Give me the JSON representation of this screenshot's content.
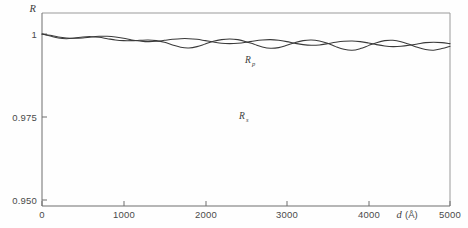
{
  "figure": {
    "background_color": "#fefefe",
    "curve_color": "#3a3a3a",
    "axis_color": "#6e6e6e"
  },
  "axes": {
    "y_title": "R",
    "x_title_symbol": "d",
    "x_title_unit": "(Å)",
    "y_ticks": [
      {
        "value": 1.0,
        "label": "1"
      },
      {
        "value": 0.975,
        "label": "0.975"
      },
      {
        "value": 0.95,
        "label": "0.950"
      }
    ],
    "x_ticks": [
      {
        "value": 0,
        "label": "0"
      },
      {
        "value": 1000,
        "label": "1000"
      },
      {
        "value": 2000,
        "label": "2000"
      },
      {
        "value": 3000,
        "label": "3000"
      },
      {
        "value": 4000,
        "label": "4000"
      },
      {
        "value": 5000,
        "label": "5000"
      }
    ]
  },
  "annotations": {
    "label_rp_base": "R",
    "label_rp_sub": "p",
    "label_rs_base": "R",
    "label_rs_sub": "s"
  },
  "chart_data": {
    "type": "line",
    "title": "",
    "xlabel": "d (Å)",
    "ylabel": "R",
    "xlim": [
      0,
      5000
    ],
    "ylim": [
      0.95,
      1.0005
    ],
    "grid": false,
    "legend": "inline-annotations",
    "series": [
      {
        "name": "Rp",
        "label": "R_p",
        "color": "#3a3a3a",
        "x": [
          0,
          100,
          200,
          300,
          400,
          500,
          600,
          700,
          800,
          900,
          1000,
          1100,
          1200,
          1300,
          1400,
          1500,
          1600,
          1700,
          1800,
          1900,
          2000,
          2100,
          2200,
          2300,
          2400,
          2500,
          2600,
          2700,
          2800,
          2900,
          3000,
          3100,
          3200,
          3300,
          3400,
          3500,
          3600,
          3700,
          3800,
          3900,
          4000,
          4100,
          4200,
          4300,
          4400,
          4500,
          4600,
          4700,
          4800,
          4900,
          5000
        ],
        "y": [
          1.0,
          0.9996,
          0.9991,
          0.9988,
          0.9987,
          0.9988,
          0.9991,
          0.9993,
          0.9993,
          0.9991,
          0.9987,
          0.9982,
          0.9979,
          0.9977,
          0.9978,
          0.9981,
          0.9984,
          0.9986,
          0.9986,
          0.9984,
          0.998,
          0.9976,
          0.9972,
          0.9971,
          0.9972,
          0.9975,
          0.9979,
          0.9982,
          0.9983,
          0.9981,
          0.9977,
          0.9972,
          0.9968,
          0.9966,
          0.9967,
          0.9971,
          0.9975,
          0.9978,
          0.9979,
          0.9977,
          0.9973,
          0.9968,
          0.9964,
          0.9962,
          0.9963,
          0.9966,
          0.997,
          0.9974,
          0.9975,
          0.9974,
          0.9971
        ]
      },
      {
        "name": "Rs",
        "label": "R_s",
        "color": "#3a3a3a",
        "x": [
          0,
          100,
          200,
          300,
          400,
          500,
          600,
          700,
          800,
          900,
          1000,
          1100,
          1200,
          1300,
          1400,
          1500,
          1600,
          1700,
          1800,
          1900,
          2000,
          2100,
          2200,
          2300,
          2400,
          2500,
          2600,
          2700,
          2800,
          2900,
          3000,
          3100,
          3200,
          3300,
          3400,
          3500,
          3600,
          3700,
          3800,
          3900,
          4000,
          4100,
          4200,
          4300,
          4400,
          4500,
          4600,
          4700,
          4800,
          4900,
          5000
        ],
        "y": [
          1.0,
          0.9994,
          0.9988,
          0.9986,
          0.9988,
          0.9991,
          0.9992,
          0.999,
          0.9986,
          0.9982,
          0.998,
          0.998,
          0.9981,
          0.9982,
          0.998,
          0.9975,
          0.9967,
          0.996,
          0.9958,
          0.9962,
          0.997,
          0.9978,
          0.9983,
          0.9985,
          0.9983,
          0.9977,
          0.9969,
          0.9961,
          0.9957,
          0.9959,
          0.9966,
          0.9974,
          0.998,
          0.9982,
          0.9979,
          0.9972,
          0.9962,
          0.9954,
          0.9951,
          0.9956,
          0.9965,
          0.9974,
          0.998,
          0.9981,
          0.9977,
          0.9969,
          0.996,
          0.9953,
          0.9951,
          0.9956,
          0.9963
        ]
      }
    ]
  }
}
